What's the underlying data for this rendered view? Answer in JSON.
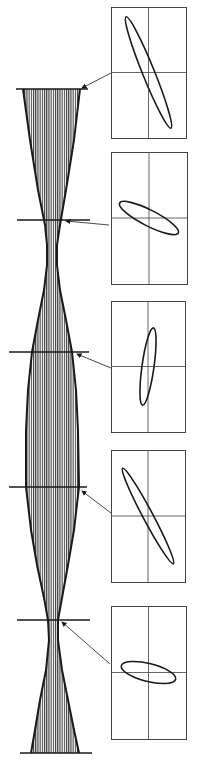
{
  "figure": {
    "description": "Beam envelope with alternating waists; horizontal section lines mark positions where phase-space ellipses are shown in inset frames",
    "ink_color": "#1a1a1a",
    "hatch_color": "#3a3a3a",
    "background": "#ffffff"
  },
  "envelope": {
    "outline_left": [
      [
        23,
        89
      ],
      [
        30,
        140
      ],
      [
        38,
        190
      ],
      [
        45,
        225
      ],
      [
        47,
        245
      ],
      [
        47,
        265
      ],
      [
        44,
        290
      ],
      [
        38,
        320
      ],
      [
        32,
        352
      ],
      [
        28,
        390
      ],
      [
        26,
        430
      ],
      [
        26,
        487
      ],
      [
        31,
        530
      ],
      [
        37,
        565
      ],
      [
        44,
        598
      ],
      [
        48,
        620
      ],
      [
        49,
        640
      ],
      [
        46,
        670
      ],
      [
        40,
        700
      ],
      [
        35,
        730
      ],
      [
        31,
        753
      ]
    ],
    "outline_right": [
      [
        80,
        89
      ],
      [
        74,
        140
      ],
      [
        66,
        190
      ],
      [
        60,
        225
      ],
      [
        57,
        245
      ],
      [
        57,
        265
      ],
      [
        60,
        290
      ],
      [
        66,
        320
      ],
      [
        72,
        352
      ],
      [
        76,
        390
      ],
      [
        78,
        430
      ],
      [
        79,
        487
      ],
      [
        74,
        530
      ],
      [
        68,
        565
      ],
      [
        62,
        598
      ],
      [
        58,
        620
      ],
      [
        58,
        640
      ],
      [
        62,
        670
      ],
      [
        68,
        700
      ],
      [
        74,
        730
      ],
      [
        79,
        753
      ]
    ]
  },
  "sections": [
    {
      "id": 1,
      "line": {
        "x1": 16,
        "x2": 88,
        "y": 89
      },
      "arrow": {
        "from": [
          111,
          73
        ],
        "to": [
          82,
          88
        ]
      },
      "panel": {
        "x": 111,
        "y": 7,
        "w": 75,
        "h": 131
      },
      "ellipse": {
        "rx": 6,
        "ry": 60,
        "angle": -22
      }
    },
    {
      "id": 2,
      "line": {
        "x1": 17,
        "x2": 90,
        "y": 220
      },
      "arrow": {
        "from": [
          109,
          225
        ],
        "to": [
          66,
          221
        ]
      },
      "panel": {
        "x": 111,
        "y": 152,
        "w": 76,
        "h": 132
      },
      "ellipse": {
        "rx": 33,
        "ry": 8,
        "angle": 27
      }
    },
    {
      "id": 3,
      "line": {
        "x1": 9,
        "x2": 89,
        "y": 352
      },
      "arrow": {
        "from": [
          111,
          368
        ],
        "to": [
          77,
          354
        ]
      },
      "panel": {
        "x": 111,
        "y": 301,
        "w": 74,
        "h": 131
      },
      "ellipse": {
        "rx": 6,
        "ry": 39,
        "angle": 8
      }
    },
    {
      "id": 4,
      "line": {
        "x1": 9,
        "x2": 87,
        "y": 487
      },
      "arrow": {
        "from": [
          111,
          513
        ],
        "to": [
          82,
          491
        ]
      },
      "panel": {
        "x": 111,
        "y": 450,
        "w": 74,
        "h": 132
      },
      "ellipse": {
        "rx": 5,
        "ry": 54,
        "angle": -28
      }
    },
    {
      "id": 5,
      "line": {
        "x1": 17,
        "x2": 90,
        "y": 620
      },
      "arrow": {
        "from": [
          110,
          664
        ],
        "to": [
          62,
          622
        ]
      },
      "panel": {
        "x": 111,
        "y": 606,
        "w": 75,
        "h": 133
      },
      "ellipse": {
        "rx": 28,
        "ry": 9,
        "angle": 14
      }
    }
  ],
  "end_lines": [
    {
      "x1": 20,
      "x2": 92,
      "y": 753
    }
  ]
}
